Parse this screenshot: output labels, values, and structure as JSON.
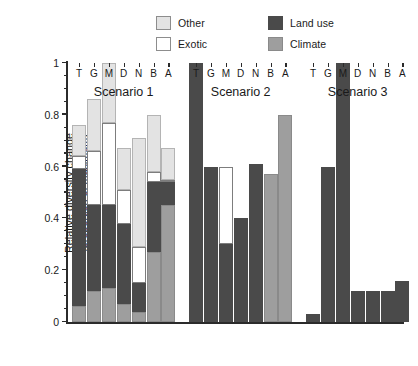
{
  "legend": {
    "entries": [
      {
        "label": "Other",
        "color": "#e3e3e3",
        "name": "other"
      },
      {
        "label": "Exotic",
        "color": "#ffffff",
        "name": "exotic"
      },
      {
        "label": "Land use",
        "color": "#4a4a4a",
        "name": "land-use"
      },
      {
        "label": "Climate",
        "color": "#9e9e9e",
        "name": "climate"
      }
    ]
  },
  "axis": {
    "ylabel_line1": "Relative diversity change",
    "ylabel_line2": "(proportion of maximum)",
    "yticks": [
      "0",
      "0.2",
      "0.4",
      "0.6",
      "0.8",
      "1"
    ]
  },
  "chart_data": {
    "type": "bar",
    "title": "",
    "xlabel": "",
    "ylabel": "Relative diversity change (proportion of maximum)",
    "ylim": [
      0,
      1
    ],
    "ytick_values": [
      0,
      0.2,
      0.4,
      0.6,
      0.8,
      1
    ],
    "grid": false,
    "stacked": true,
    "legend_position": "top-center",
    "stack_order_bottom_to_top": [
      "Climate",
      "Land use",
      "Exotic",
      "Other"
    ],
    "categories": [
      "T",
      "G",
      "M",
      "D",
      "N",
      "B",
      "A"
    ],
    "groups": [
      {
        "name": "Scenario 1",
        "bars": [
          {
            "category": "T",
            "Climate": 0.06,
            "Land use": 0.53,
            "Exotic": 0.05,
            "Other": 0.12,
            "total": 0.76
          },
          {
            "category": "G",
            "Climate": 0.12,
            "Land use": 0.33,
            "Exotic": 0.21,
            "Other": 0.2,
            "total": 0.86
          },
          {
            "category": "M",
            "Climate": 0.13,
            "Land use": 0.32,
            "Exotic": 0.32,
            "Other": 0.23,
            "total": 1.0
          },
          {
            "category": "D",
            "Climate": 0.07,
            "Land use": 0.31,
            "Exotic": 0.13,
            "Other": 0.16,
            "total": 0.67
          },
          {
            "category": "N",
            "Climate": 0.04,
            "Land use": 0.11,
            "Exotic": 0.14,
            "Other": 0.42,
            "total": 0.71
          },
          {
            "category": "B",
            "Climate": 0.27,
            "Land use": 0.27,
            "Exotic": 0.04,
            "Other": 0.22,
            "total": 0.8
          },
          {
            "category": "A",
            "Climate": 0.45,
            "Land use": 0.09,
            "Exotic": 0.01,
            "Other": 0.12,
            "total": 0.67
          }
        ]
      },
      {
        "name": "Scenario 2",
        "bars": [
          {
            "category": "T",
            "Climate": 0.0,
            "Land use": 1.0,
            "Exotic": 0.0,
            "Other": 0.0,
            "total": 1.0
          },
          {
            "category": "G",
            "Climate": 0.0,
            "Land use": 0.6,
            "Exotic": 0.0,
            "Other": 0.0,
            "total": 0.6
          },
          {
            "category": "M",
            "Climate": 0.0,
            "Land use": 0.3,
            "Exotic": 0.3,
            "Other": 0.0,
            "total": 0.6
          },
          {
            "category": "D",
            "Climate": 0.0,
            "Land use": 0.4,
            "Exotic": 0.0,
            "Other": 0.0,
            "total": 0.4
          },
          {
            "category": "N",
            "Climate": 0.0,
            "Land use": 0.61,
            "Exotic": 0.0,
            "Other": 0.0,
            "total": 0.61
          },
          {
            "category": "B",
            "Climate": 0.57,
            "Land use": 0.0,
            "Exotic": 0.0,
            "Other": 0.0,
            "total": 0.57
          },
          {
            "category": "A",
            "Climate": 0.8,
            "Land use": 0.0,
            "Exotic": 0.0,
            "Other": 0.0,
            "total": 0.8
          }
        ]
      },
      {
        "name": "Scenario 3",
        "bars": [
          {
            "category": "T",
            "Climate": 0.0,
            "Land use": 0.03,
            "Exotic": 0.0,
            "Other": 0.0,
            "total": 0.03
          },
          {
            "category": "G",
            "Climate": 0.0,
            "Land use": 0.6,
            "Exotic": 0.0,
            "Other": 0.0,
            "total": 0.6
          },
          {
            "category": "M",
            "Climate": 0.0,
            "Land use": 1.0,
            "Exotic": 0.0,
            "Other": 0.0,
            "total": 1.0
          },
          {
            "category": "D",
            "Climate": 0.0,
            "Land use": 0.12,
            "Exotic": 0.0,
            "Other": 0.0,
            "total": 0.12
          },
          {
            "category": "N",
            "Climate": 0.0,
            "Land use": 0.12,
            "Exotic": 0.0,
            "Other": 0.0,
            "total": 0.12
          },
          {
            "category": "B",
            "Climate": 0.0,
            "Land use": 0.12,
            "Exotic": 0.0,
            "Other": 0.0,
            "total": 0.12
          },
          {
            "category": "A",
            "Climate": 0.0,
            "Land use": 0.16,
            "Exotic": 0.0,
            "Other": 0.0,
            "total": 0.16
          }
        ]
      }
    ]
  }
}
